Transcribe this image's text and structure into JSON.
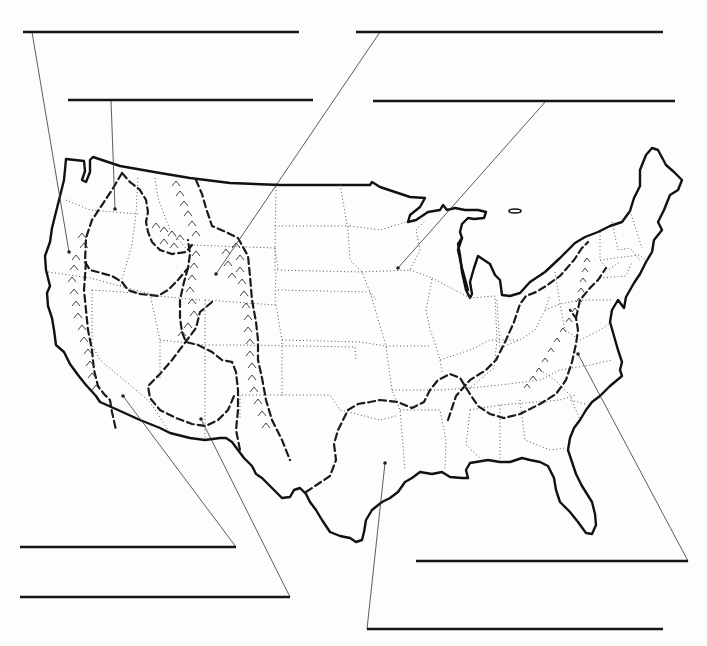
{
  "worksheet": {
    "type": "blank-label-map",
    "subject": "physiographic regions of the contiguous United States",
    "colors": {
      "ink": "#111111",
      "paper": "#fdfdfd",
      "state_border": "#555555"
    },
    "legend_styles": {
      "coastline_and_border": "solid heavy line",
      "state_boundaries": "dotted line",
      "region_boundaries": "heavy dashed line",
      "mountain_ranges": "chevron hatching"
    },
    "label_blanks": [
      {
        "id": "blank-1",
        "position": "top-left-upper",
        "answer": "",
        "points_to": "Pacific coast (Washington/Oregon)"
      },
      {
        "id": "blank-2",
        "position": "top-left-lower",
        "answer": "",
        "points_to": "Columbia Plateau (eastern Oregon/Washington)"
      },
      {
        "id": "blank-3",
        "position": "top-right-upper",
        "answer": "",
        "points_to": "Rocky Mountains (Wyoming)"
      },
      {
        "id": "blank-4",
        "position": "top-right-lower",
        "answer": "",
        "points_to": "Interior Plains (Minnesota/Iowa)"
      },
      {
        "id": "blank-5",
        "position": "bottom-left-upper",
        "answer": "",
        "points_to": "Basin and Range (Nevada)"
      },
      {
        "id": "blank-6",
        "position": "bottom-left-lower",
        "answer": "",
        "points_to": "Colorado Plateau (Arizona/Utah)"
      },
      {
        "id": "blank-7",
        "position": "bottom-right-upper",
        "answer": "",
        "points_to": "Appalachian region (Carolinas)"
      },
      {
        "id": "blank-8",
        "position": "bottom-right-lower",
        "answer": "",
        "points_to": "Gulf Coastal Plain (Louisiana/Texas)"
      }
    ]
  }
}
